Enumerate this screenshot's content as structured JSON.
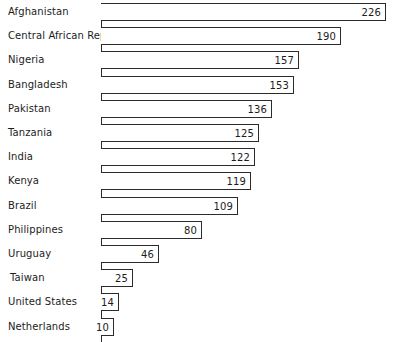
{
  "chart_data": {
    "type": "bar",
    "orientation": "horizontal",
    "title": "",
    "subtitle": "",
    "xlabel": "",
    "ylabel": "",
    "grid": false,
    "legend": null,
    "axis_origin_value": 0,
    "xlim": [
      0,
      232
    ],
    "value_labels_shown": true,
    "value_label_position": "inside-end",
    "categories": [
      "Afghanistan",
      "Central African Rep.",
      "Nigeria",
      "Bangladesh",
      "Pakistan",
      "Tanzania",
      "India",
      "Kenya",
      "Brazil",
      "Philippines",
      "Uruguay",
      "Taiwan",
      "United States",
      "Netherlands"
    ],
    "values": [
      226,
      190,
      157,
      153,
      136,
      125,
      122,
      119,
      109,
      80,
      46,
      25,
      14,
      10
    ],
    "bars": [
      {
        "category": "Afghanistan",
        "value": 226,
        "label": "226"
      },
      {
        "category": "Central African Rep.",
        "value": 190,
        "label": "190"
      },
      {
        "category": "Nigeria",
        "value": 157,
        "label": "157"
      },
      {
        "category": "Bangladesh",
        "value": 153,
        "label": "153"
      },
      {
        "category": "Pakistan",
        "value": 136,
        "label": "136"
      },
      {
        "category": "Tanzania",
        "value": 125,
        "label": "125"
      },
      {
        "category": "India",
        "value": 122,
        "label": "122"
      },
      {
        "category": "Kenya",
        "value": 119,
        "label": "119"
      },
      {
        "category": "Brazil",
        "value": 109,
        "label": "109"
      },
      {
        "category": "Philippines",
        "value": 80,
        "label": "80"
      },
      {
        "category": "Uruguay",
        "value": 46,
        "label": "46"
      },
      {
        "category": "Taiwan",
        "value": 25,
        "label": "25"
      },
      {
        "category": "United States",
        "value": 14,
        "label": "14"
      },
      {
        "category": "Netherlands",
        "value": 10,
        "label": "10"
      }
    ],
    "colors": {
      "bar_fill": "#ffffff",
      "bar_stroke": "#2b2b2b",
      "axis": "#2b2b2b",
      "text": "#1c1c1c",
      "background": "#ffffff"
    }
  },
  "layout": {
    "origin_x": 101,
    "px_per_unit": 1.261,
    "row_pitch": 24.2,
    "bar_height": 18,
    "first_bar_top": 3,
    "indented_categories": [
      "Taiwan"
    ]
  }
}
